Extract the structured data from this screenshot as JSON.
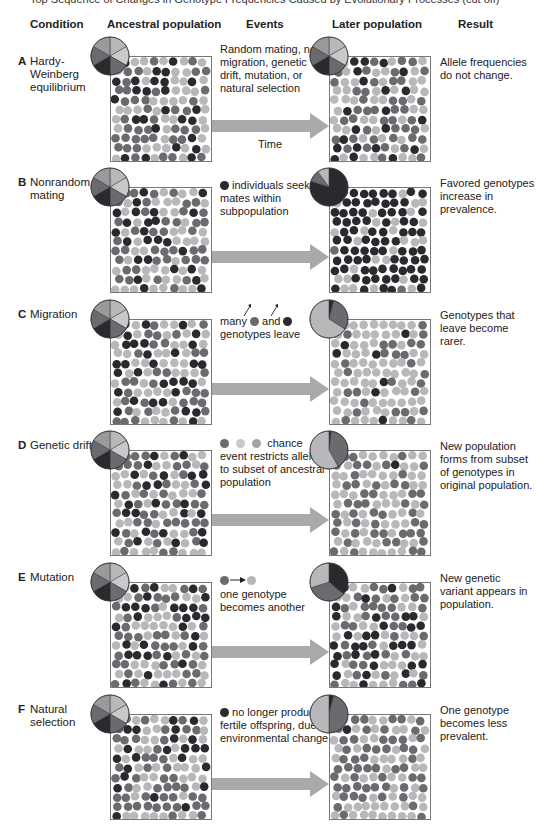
{
  "top_caption": "Top Sequence of Changes in Genotype Frequencies Caused by Evolutionary Processes (cut off)",
  "headers": {
    "condition": "Condition",
    "ancestral": "Ancestral population",
    "events": "Events",
    "later": "Later population",
    "result": "Result"
  },
  "colors": {
    "dark": "#2a2a2e",
    "medium": "#6b6b6f",
    "light": "#b8b8ba",
    "arrow": "#a9a9ab"
  },
  "rows": [
    {
      "letter": "A",
      "condition": "Hardy-Weinberg equilibrium",
      "events": "Random mating, no migration, genetic drift, mutation, or natural selection",
      "time_label": "Time",
      "result": "Allele frequencies do not change.",
      "ancestral_pie": [
        33,
        33,
        34
      ],
      "later_pie": [
        33,
        33,
        34
      ]
    },
    {
      "letter": "B",
      "condition": "Nonrandom mating",
      "events": "individuals seek mates within subpopulation",
      "result": "Favored genotypes increase in prevalence.",
      "ancestral_pie": [
        33,
        33,
        34
      ],
      "later_pie": [
        80,
        10,
        10
      ]
    },
    {
      "letter": "C",
      "condition": "Migration",
      "events_prefix": "many",
      "events_mid": "and",
      "events": "genotypes leave",
      "result": "Genotypes that leave become rarer.",
      "ancestral_pie": [
        33,
        33,
        34
      ],
      "later_pie": [
        4,
        30,
        66
      ]
    },
    {
      "letter": "D",
      "condition": "Genetic drift",
      "events_suffix": "chance",
      "events": "event restricts alleles to subset of ancestral population",
      "result": "New population forms from subset of genotypes in original population.",
      "ancestral_pie": [
        33,
        33,
        34
      ],
      "later_pie": [
        2,
        40,
        58
      ]
    },
    {
      "letter": "E",
      "condition": "Mutation",
      "events": "one genotype becomes another",
      "result": "New genetic variant appears in population.",
      "ancestral_pie": [
        33,
        33,
        34
      ],
      "later_pie": [
        36,
        34,
        30
      ]
    },
    {
      "letter": "F",
      "condition": "Natural selection",
      "events": "no longer produces fertile offspring, due to environmental change",
      "result": "One genotype becomes less prevalent.",
      "ancestral_pie": [
        33,
        33,
        34
      ],
      "later_pie": [
        4,
        46,
        50
      ]
    }
  ]
}
